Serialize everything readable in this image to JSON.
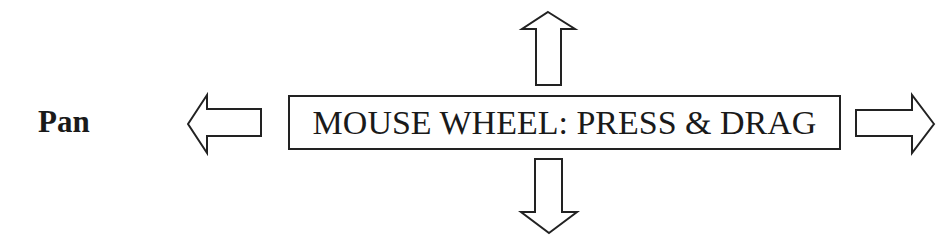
{
  "diagram": {
    "title_label": "Pan",
    "action_box": {
      "text": "MOUSE WHEEL: PRESS & DRAG"
    },
    "arrows": [
      {
        "direction": "left",
        "icon": "arrow-left-icon"
      },
      {
        "direction": "right",
        "icon": "arrow-right-icon"
      },
      {
        "direction": "up",
        "icon": "arrow-up-icon"
      },
      {
        "direction": "down",
        "icon": "arrow-down-icon"
      }
    ],
    "colors": {
      "stroke": "#222222",
      "background": "#ffffff",
      "text": "#1a1a1a"
    }
  }
}
